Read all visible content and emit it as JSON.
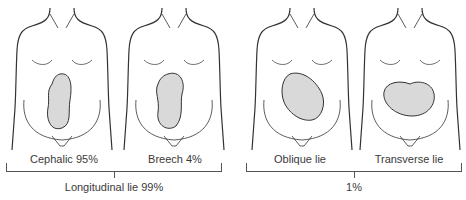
{
  "figures": [
    {
      "id": "cephalic",
      "label": "Cephalic 95%",
      "fetus_orientation": "vertical-head-down"
    },
    {
      "id": "breech",
      "label": "Breech 4%",
      "fetus_orientation": "vertical-head-up"
    },
    {
      "id": "oblique",
      "label": "Oblique lie",
      "fetus_orientation": "diagonal"
    },
    {
      "id": "transverse",
      "label": "Transverse lie",
      "fetus_orientation": "horizontal"
    }
  ],
  "groups": [
    {
      "id": "longitudinal",
      "label": "Longitudinal lie 99%"
    },
    {
      "id": "other",
      "label": "1%"
    }
  ],
  "colors": {
    "outline": "#333333",
    "fetus_fill": "#d9d9d9",
    "bracket": "#555555",
    "text": "#3a3a3a"
  }
}
